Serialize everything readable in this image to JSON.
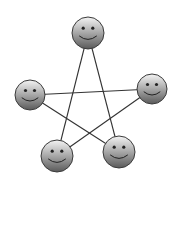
{
  "diagram": {
    "title": "",
    "node_icon": "smiley-face-icon",
    "nodes": [
      {
        "id": "top",
        "label": ""
      },
      {
        "id": "left",
        "label": ""
      },
      {
        "id": "right",
        "label": ""
      },
      {
        "id": "bottom-left",
        "label": ""
      },
      {
        "id": "bottom-right",
        "label": ""
      }
    ],
    "edges": [
      {
        "from": "top",
        "to": "bottom-left"
      },
      {
        "from": "top",
        "to": "bottom-right"
      },
      {
        "from": "left",
        "to": "right"
      },
      {
        "from": "left",
        "to": "bottom-right"
      },
      {
        "from": "right",
        "to": "bottom-left"
      }
    ],
    "colors": {
      "line": "#333333",
      "face_top": "#f4f4f4",
      "face_bottom": "#5a5a5a",
      "outline": "#3a3a3a",
      "features": "#222222"
    }
  }
}
